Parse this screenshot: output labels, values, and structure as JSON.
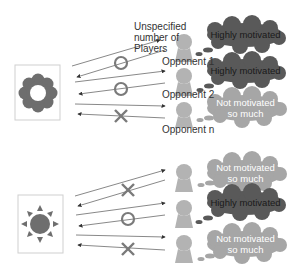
{
  "colors": {
    "highly_cloud": "#595959",
    "highly_text": "#1a1a1a",
    "low_cloud": "#a6a6a6",
    "low_text": "#ffffff",
    "person": "#b3b3b3",
    "mark": "#7a7a7a",
    "icon": "#6e6e6e",
    "arrow": "#555555"
  },
  "top_group": {
    "source_icon": "flower-icon",
    "header_label": "Unspecified\nnumber of\nPlayers",
    "opponents": [
      {
        "label": "Opponent 1",
        "mark": "circle",
        "thought": "Highly motivated",
        "motivation": "high"
      },
      {
        "label": "Opponent 2",
        "mark": "circle",
        "thought": "Highly motivated",
        "motivation": "high"
      },
      {
        "label": "Opponent n",
        "mark": "cross",
        "thought": "Not motivated\nso much",
        "motivation": "low"
      }
    ]
  },
  "bottom_group": {
    "source_icon": "sun-icon",
    "opponents": [
      {
        "label": "",
        "mark": "cross",
        "thought": "Not motivated\nso much",
        "motivation": "low"
      },
      {
        "label": "",
        "mark": "circle",
        "thought": "Highly motivated",
        "motivation": "high"
      },
      {
        "label": "",
        "mark": "cross",
        "thought": "Not motivated\nso much",
        "motivation": "low"
      }
    ]
  },
  "labels": {
    "header_l1": "Unspecified",
    "header_l2": "number of",
    "header_l3": "Players",
    "opp1": "Opponent 1",
    "opp2": "Opponent 2",
    "oppn": "Opponent n",
    "t_high": "Highly motivated",
    "t_low_l1": "Not motivated",
    "t_low_l2": "so much"
  }
}
